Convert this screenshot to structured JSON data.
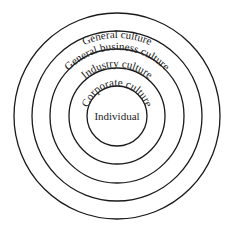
{
  "diagram": {
    "type": "concentric-circles",
    "center": [
      117,
      116
    ],
    "stroke_color": "#1a1a1a",
    "text_color": "#222222",
    "layers": [
      {
        "label": "General culture",
        "radius": 103
      },
      {
        "label": "General business culture",
        "radius": 85
      },
      {
        "label": "Industry culture",
        "radius": 67
      },
      {
        "label": "Corporate culture",
        "radius": 48
      },
      {
        "label": "Individual",
        "radius": 30
      }
    ]
  }
}
